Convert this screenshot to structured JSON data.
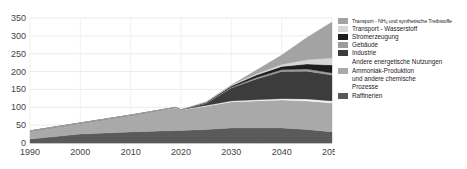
{
  "chart_data": {
    "type": "area",
    "stacked": true,
    "title": "",
    "xlabel": "",
    "ylabel": "",
    "x": [
      1990,
      2000,
      2010,
      2019,
      2020,
      2025,
      2030,
      2035,
      2040,
      2045,
      2050
    ],
    "xticks": [
      "1990",
      "2000",
      "2010",
      "2020",
      "2030",
      "2040",
      "2050"
    ],
    "yticks": [
      "0",
      "50",
      "100",
      "150",
      "200",
      "250",
      "300",
      "350"
    ],
    "ylim": [
      0,
      350
    ],
    "xlim": [
      1990,
      2050
    ],
    "grid": true,
    "legend_position": "right",
    "series": [
      {
        "name": "Raffinerien",
        "color": "#5a5a5a",
        "values": [
          11,
          25,
          31,
          35,
          35,
          38,
          42,
          42,
          42,
          38,
          31
        ]
      },
      {
        "name": "Ammoniak-Produktion und andere chemische Prozesse",
        "color": "#a9a9a9",
        "values": [
          23,
          31,
          47,
          63,
          57,
          65,
          73,
          76,
          78,
          80,
          81
        ]
      },
      {
        "name": "Andere energetische Nutzungen",
        "color": "#f2f2f2",
        "values": [
          0,
          0,
          0,
          1,
          1,
          2,
          3,
          3,
          4,
          5,
          6
        ]
      },
      {
        "name": "Industrie",
        "color": "#3c3c3c",
        "values": [
          0,
          0,
          0,
          1,
          0,
          6,
          36,
          58,
          76,
          78,
          72
        ]
      },
      {
        "name": "Gebäude",
        "color": "#9b9b9b",
        "values": [
          0,
          0,
          0,
          0,
          0,
          1,
          2,
          4,
          5,
          6,
          6
        ]
      },
      {
        "name": "Stromerzeugung",
        "color": "#1e1e1e",
        "values": [
          0,
          0,
          0,
          0,
          0,
          2,
          4,
          7,
          9,
          14,
          22
        ]
      },
      {
        "name": "Transport - Wasserstoff",
        "color": "#d6d6d6",
        "values": [
          0,
          0,
          0,
          0,
          0,
          1,
          2,
          4,
          6,
          12,
          20
        ]
      },
      {
        "name": "Transport - NH3 und synthetische Treibstoffe",
        "color": "#a3a3a3",
        "values": [
          0,
          0,
          0,
          0,
          0,
          0,
          0,
          10,
          26,
          62,
          101
        ]
      }
    ]
  },
  "legend": {
    "items": [
      {
        "label": "Transport - NH₃ und synthetische Treibstoffe",
        "color": "#a3a3a3",
        "small": true
      },
      {
        "label": "Transport - Wasserstoff",
        "color": "#d6d6d6"
      },
      {
        "label": "Stromerzeugung",
        "color": "#1e1e1e"
      },
      {
        "label": "Gebäude",
        "color": "#9b9b9b"
      },
      {
        "label": "Industrie",
        "color": "#3c3c3c"
      },
      {
        "label": "Andere energetische Nutzungen",
        "color": "#ffffff"
      },
      {
        "label": "Ammoniak-Produktion",
        "color": "#a9a9a9"
      },
      {
        "label": "und andere chemische",
        "color": null
      },
      {
        "label": "Prozesse",
        "color": null
      },
      {
        "label": "Raffinerien",
        "color": "#5a5a5a"
      }
    ]
  }
}
